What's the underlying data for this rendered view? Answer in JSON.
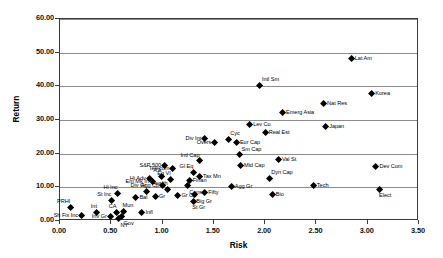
{
  "chart_data": {
    "type": "scatter",
    "title": "",
    "xlabel": "Risk",
    "ylabel": "Return",
    "xlim": [
      0.0,
      3.5
    ],
    "ylim": [
      0.0,
      60.0
    ],
    "xticks": [
      "0.00",
      "0.50",
      "1.00",
      "1.50",
      "2.00",
      "2.50",
      "3.00",
      "3.50"
    ],
    "yticks": [
      "0.00",
      "10.00",
      "20.00",
      "30.00",
      "40.00",
      "50.00",
      "60.00"
    ],
    "xtick_values": [
      0.0,
      0.5,
      1.0,
      1.5,
      2.0,
      2.5,
      3.0,
      3.5
    ],
    "ytick_values": [
      0,
      10,
      20,
      30,
      40,
      50,
      60
    ],
    "grid": "horizontal",
    "legend": "none",
    "marker": "diamond",
    "marker_color": "#000000",
    "points": [
      {
        "label": "Sh Fix Inc",
        "x": 0.21,
        "y": 1.6,
        "pos": "left"
      },
      {
        "label": "Int",
        "x": 0.36,
        "y": 2.6,
        "pos": "above-left"
      },
      {
        "label": "PRHI",
        "x": 0.1,
        "y": 3.9,
        "pos": "above-left"
      },
      {
        "label": "Inv Gr",
        "x": 0.49,
        "y": 1.4,
        "pos": "left"
      },
      {
        "label": "CA",
        "x": 0.55,
        "y": 2.5,
        "pos": "above-left"
      },
      {
        "label": "NY",
        "x": 0.57,
        "y": 0.6,
        "pos": "below-right"
      },
      {
        "label": "Mun",
        "x": 0.62,
        "y": 2.7,
        "pos": "above"
      },
      {
        "label": "Infl",
        "x": 0.8,
        "y": 2.4,
        "pos": "right"
      },
      {
        "label": "Gov",
        "x": 0.6,
        "y": 1.2,
        "pos": "below-right"
      },
      {
        "label": "St Inc",
        "x": 0.5,
        "y": 6.2,
        "pos": "above-left"
      },
      {
        "label": "Hi Inc",
        "x": 0.56,
        "y": 8.2,
        "pos": "above-left"
      },
      {
        "label": "Bal",
        "x": 0.74,
        "y": 7.1,
        "pos": "right"
      },
      {
        "label": "Div Gr",
        "x": 0.84,
        "y": 8.8,
        "pos": "above-left"
      },
      {
        "label": "Hi Adv",
        "x": 0.87,
        "y": 12.6,
        "pos": "left"
      },
      {
        "label": "Em Mk In",
        "x": 0.9,
        "y": 11.7,
        "pos": "left"
      },
      {
        "label": "Gr",
        "x": 0.93,
        "y": 7.2,
        "pos": "right"
      },
      {
        "label": "A A",
        "x": 0.99,
        "y": 13.2,
        "pos": "above-left"
      },
      {
        "label": "Agg Cp",
        "x": 1.0,
        "y": 10.6,
        "pos": "left"
      },
      {
        "label": "Health",
        "x": 1.05,
        "y": 9.4,
        "pos": "above-left"
      },
      {
        "label": "Eq VI",
        "x": 1.08,
        "y": 12.2,
        "pos": "above-left"
      },
      {
        "label": "Telecom",
        "x": 1.1,
        "y": 15.6,
        "pos": "left"
      },
      {
        "label": "S&P 500",
        "x": 1.02,
        "y": 16.6,
        "pos": "left"
      },
      {
        "label": "Gr Cp",
        "x": 1.15,
        "y": 7.5,
        "pos": "right"
      },
      {
        "label": "Cons",
        "x": 1.24,
        "y": 10.4,
        "pos": "below-right"
      },
      {
        "label": "Finan",
        "x": 1.26,
        "y": 12.1,
        "pos": "right"
      },
      {
        "label": "Gl Eq",
        "x": 1.3,
        "y": 14.5,
        "pos": "above-left"
      },
      {
        "label": "Intl Cap",
        "x": 1.36,
        "y": 17.8,
        "pos": "above-left"
      },
      {
        "label": "Tax Mn",
        "x": 1.36,
        "y": 13.2,
        "pos": "right"
      },
      {
        "label": "Big Gr",
        "x": 1.31,
        "y": 7.7,
        "pos": "below-right"
      },
      {
        "label": "St Gr",
        "x": 1.3,
        "y": 5.9,
        "pos": "below"
      },
      {
        "label": "Fifty",
        "x": 1.41,
        "y": 8.5,
        "pos": "right"
      },
      {
        "label": "Div Int",
        "x": 1.41,
        "y": 24.4,
        "pos": "left"
      },
      {
        "label": "Overs",
        "x": 1.51,
        "y": 23.3,
        "pos": "left"
      },
      {
        "label": "Cyc",
        "x": 1.64,
        "y": 24.2,
        "pos": "above-right"
      },
      {
        "label": "Eur Cap",
        "x": 1.72,
        "y": 23.4,
        "pos": "right"
      },
      {
        "label": "Mid Cap",
        "x": 1.76,
        "y": 16.4,
        "pos": "right"
      },
      {
        "label": "Sm Cap",
        "x": 1.75,
        "y": 19.6,
        "pos": "above-right"
      },
      {
        "label": "Agg Gr",
        "x": 1.67,
        "y": 10.2,
        "pos": "right"
      },
      {
        "label": "Lev Co",
        "x": 1.85,
        "y": 28.7,
        "pos": "right"
      },
      {
        "label": "Intl Sm",
        "x": 1.95,
        "y": 40.3,
        "pos": "above-right"
      },
      {
        "label": "Real Est",
        "x": 2.0,
        "y": 26.4,
        "pos": "right"
      },
      {
        "label": "Val St",
        "x": 2.13,
        "y": 18.3,
        "pos": "right"
      },
      {
        "label": "Dyn Cap",
        "x": 2.04,
        "y": 12.6,
        "pos": "above-right"
      },
      {
        "label": "Bio",
        "x": 2.07,
        "y": 7.9,
        "pos": "right"
      },
      {
        "label": "Emerg Asia",
        "x": 2.17,
        "y": 32.2,
        "pos": "right"
      },
      {
        "label": "Tech",
        "x": 2.47,
        "y": 10.6,
        "pos": "right"
      },
      {
        "label": "Nat Res",
        "x": 2.57,
        "y": 34.8,
        "pos": "right"
      },
      {
        "label": "Japan",
        "x": 2.59,
        "y": 27.9,
        "pos": "right"
      },
      {
        "label": "Lat Am",
        "x": 2.84,
        "y": 48.1,
        "pos": "right"
      },
      {
        "label": "Korea",
        "x": 3.04,
        "y": 37.7,
        "pos": "right"
      },
      {
        "label": "Dev Com",
        "x": 3.08,
        "y": 16.3,
        "pos": "right"
      },
      {
        "label": "Elect",
        "x": 3.12,
        "y": 9.3,
        "pos": "below"
      }
    ]
  }
}
